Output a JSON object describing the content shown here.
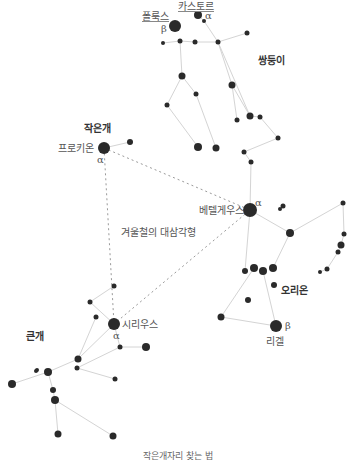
{
  "diagram": {
    "caption": "작은개자리 찾는 법",
    "triangle_label": "겨울철의 대삼각형",
    "colors": {
      "star": "#2a2a2a",
      "line": "#d4d4d4",
      "dashed": "#9a9a9a",
      "text": "#555555"
    },
    "constellations": [
      {
        "name": "쌍둥이",
        "x": 258,
        "y": 60
      },
      {
        "name": "작은개",
        "x": 94,
        "y": 128
      },
      {
        "name": "오리온",
        "x": 291,
        "y": 290
      },
      {
        "name": "큰개",
        "x": 36,
        "y": 335
      }
    ],
    "named_stars": [
      {
        "name": "카스토르",
        "greek": "α",
        "x": 200,
        "y": 16
      },
      {
        "name": "폴룩스",
        "greek": "β",
        "x": 175,
        "y": 26
      },
      {
        "name": "프로키온",
        "greek": "α",
        "x": 104,
        "y": 148
      },
      {
        "name": "베텔게우스",
        "greek": "α",
        "x": 250,
        "y": 210
      },
      {
        "name": "시리우스",
        "greek": "α",
        "x": 114,
        "y": 324
      },
      {
        "name": "리겔",
        "greek": "β",
        "x": 276,
        "y": 327
      }
    ],
    "stars": [
      [
        198,
        15,
        4
      ],
      [
        204,
        21,
        2
      ],
      [
        175,
        26,
        6
      ],
      [
        163,
        43,
        2
      ],
      [
        180,
        41,
        2.5
      ],
      [
        195,
        42,
        2.5
      ],
      [
        218,
        42,
        2.5
      ],
      [
        247,
        33,
        2.5
      ],
      [
        182,
        76,
        3.5
      ],
      [
        167,
        105,
        2.5
      ],
      [
        196,
        94,
        2.5
      ],
      [
        232,
        85,
        3.5
      ],
      [
        216,
        148,
        3.5
      ],
      [
        198,
        147,
        4
      ],
      [
        250,
        116,
        3.5
      ],
      [
        260,
        117,
        2.5
      ],
      [
        237,
        120,
        2.5
      ],
      [
        278,
        138,
        2.5
      ],
      [
        244,
        152,
        2.5
      ],
      [
        251,
        162,
        2.5
      ],
      [
        104,
        148,
        6
      ],
      [
        130,
        142,
        3
      ],
      [
        250,
        210,
        7
      ],
      [
        283,
        206,
        2.5
      ],
      [
        280,
        209,
        2
      ],
      [
        290,
        233,
        4
      ],
      [
        343,
        203,
        2.5
      ],
      [
        344,
        234,
        2.5
      ],
      [
        341,
        245,
        3.5
      ],
      [
        338,
        252,
        2.5
      ],
      [
        327,
        269,
        2.5
      ],
      [
        320,
        272,
        2
      ],
      [
        245,
        271,
        3
      ],
      [
        254,
        268,
        4
      ],
      [
        263,
        271,
        4
      ],
      [
        273,
        268,
        4
      ],
      [
        274,
        285,
        3
      ],
      [
        248,
        300,
        3
      ],
      [
        221,
        317,
        3.5
      ],
      [
        276,
        326,
        6
      ],
      [
        114,
        324,
        6
      ],
      [
        114,
        286,
        2.5
      ],
      [
        90,
        302,
        2.5
      ],
      [
        96,
        317,
        2.5
      ],
      [
        120,
        347,
        2.5
      ],
      [
        146,
        347,
        4
      ],
      [
        78,
        359,
        3.5
      ],
      [
        77,
        368,
        2.5
      ],
      [
        37,
        370,
        2
      ],
      [
        36,
        371,
        2
      ],
      [
        48,
        372,
        4
      ],
      [
        12,
        384,
        4
      ],
      [
        53,
        390,
        3
      ],
      [
        55,
        400,
        4
      ],
      [
        115,
        379,
        2.5
      ],
      [
        58,
        434,
        3.5
      ],
      [
        113,
        436,
        3.5
      ]
    ],
    "lines": [
      [
        [
          198,
          15
        ],
        [
          204,
          21
        ],
        [
          218,
          42
        ],
        [
          250,
          116
        ]
      ],
      [
        [
          163,
          43
        ],
        [
          180,
          41
        ],
        [
          195,
          42
        ],
        [
          218,
          42
        ],
        [
          247,
          33
        ]
      ],
      [
        [
          180,
          41
        ],
        [
          182,
          76
        ],
        [
          167,
          105
        ],
        [
          198,
          147
        ]
      ],
      [
        [
          182,
          76
        ],
        [
          196,
          94
        ],
        [
          216,
          148
        ]
      ],
      [
        [
          218,
          42
        ],
        [
          232,
          85
        ],
        [
          237,
          120
        ]
      ],
      [
        [
          232,
          85
        ],
        [
          250,
          116
        ],
        [
          260,
          117
        ],
        [
          278,
          138
        ]
      ],
      [
        [
          278,
          138
        ],
        [
          244,
          152
        ],
        [
          251,
          162
        ]
      ],
      [
        [
          104,
          148
        ],
        [
          130,
          142
        ]
      ],
      [
        [
          251,
          162
        ],
        [
          250,
          210
        ],
        [
          245,
          271
        ]
      ],
      [
        [
          250,
          210
        ],
        [
          290,
          233
        ],
        [
          343,
          203
        ],
        [
          344,
          234
        ],
        [
          341,
          245
        ],
        [
          338,
          252
        ],
        [
          327,
          269
        ],
        [
          320,
          272
        ]
      ],
      [
        [
          290,
          233
        ],
        [
          273,
          268
        ]
      ],
      [
        [
          254,
          268
        ],
        [
          221,
          317
        ],
        [
          276,
          326
        ],
        [
          263,
          271
        ]
      ],
      [
        [
          114,
          286
        ],
        [
          90,
          302
        ],
        [
          114,
          324
        ],
        [
          120,
          347
        ],
        [
          146,
          347
        ]
      ],
      [
        [
          114,
          324
        ],
        [
          78,
          359
        ],
        [
          48,
          372
        ],
        [
          12,
          384
        ]
      ],
      [
        [
          96,
          317
        ],
        [
          78,
          359
        ]
      ],
      [
        [
          120,
          347
        ],
        [
          77,
          368
        ],
        [
          115,
          379
        ]
      ],
      [
        [
          48,
          372
        ],
        [
          53,
          390
        ],
        [
          55,
          400
        ],
        [
          58,
          434
        ]
      ],
      [
        [
          55,
          400
        ],
        [
          113,
          436
        ]
      ]
    ],
    "triangle": [
      [
        104,
        148
      ],
      [
        250,
        210
      ],
      [
        114,
        324
      ]
    ]
  }
}
